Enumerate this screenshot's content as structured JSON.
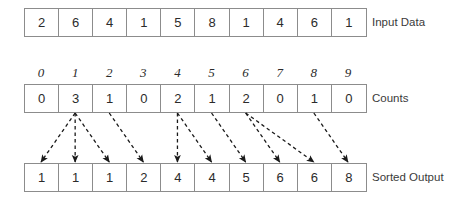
{
  "diagram": {
    "rows": [
      {
        "name": "input",
        "label": "Input Data",
        "values": [
          2,
          6,
          4,
          1,
          5,
          8,
          1,
          4,
          6,
          1
        ]
      },
      {
        "name": "counts",
        "label": "Counts",
        "indices": [
          0,
          1,
          2,
          3,
          4,
          5,
          6,
          7,
          8,
          9
        ],
        "values": [
          0,
          3,
          1,
          0,
          2,
          1,
          2,
          0,
          1,
          0
        ]
      },
      {
        "name": "output",
        "label": "Sorted Output",
        "values": [
          1,
          1,
          1,
          2,
          4,
          4,
          5,
          6,
          6,
          8
        ]
      }
    ],
    "arrows": [
      {
        "from_count_index": 1,
        "to_output_index": 0
      },
      {
        "from_count_index": 1,
        "to_output_index": 1
      },
      {
        "from_count_index": 1,
        "to_output_index": 2
      },
      {
        "from_count_index": 2,
        "to_output_index": 3
      },
      {
        "from_count_index": 4,
        "to_output_index": 4
      },
      {
        "from_count_index": 4,
        "to_output_index": 5
      },
      {
        "from_count_index": 5,
        "to_output_index": 6
      },
      {
        "from_count_index": 6,
        "to_output_index": 7
      },
      {
        "from_count_index": 6,
        "to_output_index": 8
      },
      {
        "from_count_index": 8,
        "to_output_index": 9
      }
    ],
    "colors": {
      "border": "#8c8c8c",
      "text": "#2b2b2b",
      "label": "#3a3a3a",
      "arrow": "#1a1a1a",
      "background": "#ffffff"
    }
  }
}
